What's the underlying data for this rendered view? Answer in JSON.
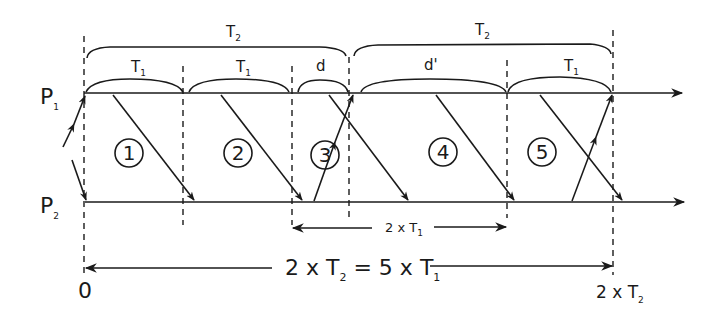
{
  "diagram": {
    "processes": [
      {
        "id": "P1",
        "label": "P",
        "sub": "1"
      },
      {
        "id": "P2",
        "label": "P",
        "sub": "2"
      }
    ],
    "top_braces": [
      {
        "label": "T",
        "sub": "2"
      },
      {
        "label": "T",
        "sub": "2"
      }
    ],
    "interval_braces": [
      {
        "label": "T",
        "sub": "1"
      },
      {
        "label": "T",
        "sub": "1"
      },
      {
        "label": "d",
        "sub": ""
      },
      {
        "label": "d'",
        "sub": ""
      },
      {
        "label": "T",
        "sub": "1"
      }
    ],
    "circled_numbers": [
      "1",
      "2",
      "3",
      "4",
      "5"
    ],
    "span_2xT1": {
      "pre": "2 x T",
      "sub": "1"
    },
    "span_total": {
      "part1": "2 x T",
      "sub1": "2",
      "part2": " = 5 x T",
      "sub2": "1"
    },
    "axis_start": "0",
    "axis_end": {
      "pre": "2 x T",
      "sub": "2"
    },
    "colors": {
      "ink": "#1a1a1a",
      "background": "#ffffff"
    }
  }
}
